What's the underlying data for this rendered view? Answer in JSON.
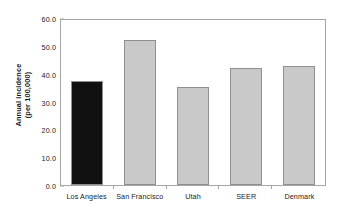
{
  "chart_data": {
    "type": "bar",
    "title": "",
    "subtitle": "",
    "xlabel": "",
    "ylabel": "Annual incidence (per 100,000)",
    "ylabel_line1": "Annual incidence",
    "ylabel_line2": "(per 100,000)",
    "categories": [
      "Los Angeles",
      "San Francisco",
      "Utah",
      "SEER",
      "Denmark"
    ],
    "values": [
      37.5,
      52.0,
      35.3,
      42.0,
      42.8
    ],
    "ylim": [
      0.0,
      60.0
    ],
    "ytick_values": [
      60.0,
      50.0,
      40.0,
      30.0,
      20.0,
      10.0,
      0.0
    ],
    "ytick_labels": [
      "60.0",
      "50.0",
      "40.0",
      "30.0",
      "20.0",
      "10.0",
      "0.0"
    ],
    "grid": false,
    "legend": false,
    "legend_position": "none",
    "bar_colors": [
      "#111111",
      "#c9c9c9",
      "#c9c9c9",
      "#c9c9c9",
      "#c9c9c9"
    ],
    "bar_edge_color": "#8f8f8f",
    "highlight_category": "Los Angeles",
    "frame_color": "#a6a6a6",
    "background_color": "#ffffff",
    "text_color": "#1a1a1a"
  }
}
